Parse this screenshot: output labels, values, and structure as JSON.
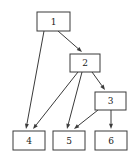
{
  "diagram": {
    "type": "directed-graph",
    "title": "",
    "background_color": "#ffffff",
    "node_fill_color": "#ffffff",
    "node_stroke_color": "#3a3a3a",
    "edge_color": "#3a3a3a",
    "label_color": "#1a1a1a",
    "nodes": [
      {
        "id": "1",
        "label": "1",
        "x": 37,
        "y": 12,
        "width": 33,
        "height": 19,
        "cx": 53.5,
        "cy": 21.5
      },
      {
        "id": "2",
        "label": "2",
        "x": 70,
        "y": 54,
        "width": 30,
        "height": 18,
        "cx": 85,
        "cy": 63
      },
      {
        "id": "3",
        "label": "3",
        "x": 95,
        "y": 92,
        "width": 31,
        "height": 18,
        "cx": 110.5,
        "cy": 101
      },
      {
        "id": "4",
        "label": "4",
        "x": 13,
        "y": 131,
        "width": 32,
        "height": 19,
        "cx": 29,
        "cy": 140.5
      },
      {
        "id": "5",
        "label": "5",
        "x": 53,
        "y": 131,
        "width": 32,
        "height": 19,
        "cx": 69,
        "cy": 140.5
      },
      {
        "id": "6",
        "label": "6",
        "x": 95,
        "y": 131,
        "width": 32,
        "height": 19,
        "cx": 111,
        "cy": 140.5
      }
    ],
    "edges": [
      {
        "from": "1",
        "to": "4",
        "x1": 44,
        "y1": 31,
        "x2": 26,
        "y2": 129
      },
      {
        "from": "1",
        "to": "2",
        "x1": 58,
        "y1": 31,
        "x2": 82,
        "y2": 52
      },
      {
        "from": "2",
        "to": "4",
        "x1": 78,
        "y1": 72,
        "x2": 33,
        "y2": 129
      },
      {
        "from": "2",
        "to": "5",
        "x1": 82,
        "y1": 72,
        "x2": 67,
        "y2": 129
      },
      {
        "from": "2",
        "to": "3",
        "x1": 92,
        "y1": 72,
        "x2": 105,
        "y2": 90
      },
      {
        "from": "3",
        "to": "5",
        "x1": 98,
        "y1": 110,
        "x2": 74,
        "y2": 129
      },
      {
        "from": "3",
        "to": "6",
        "x1": 111,
        "y1": 110,
        "x2": 111,
        "y2": 129
      }
    ]
  }
}
